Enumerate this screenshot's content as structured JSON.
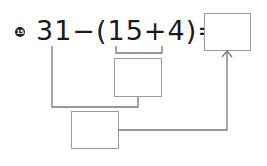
{
  "problem": {
    "number": "15",
    "expression": "31−(15+4)=",
    "answer_box_value": "",
    "step_box_value": "",
    "intermediate_box_value": ""
  },
  "colors": {
    "text": "#1a1a1a",
    "box_border": "#9a9a9a",
    "connector": "#777777"
  }
}
